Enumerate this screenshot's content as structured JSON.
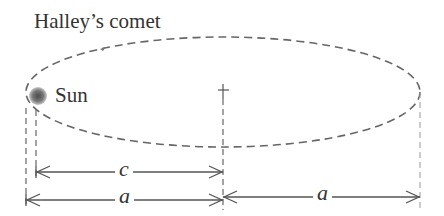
{
  "title": "Halley’s comet",
  "labels": {
    "sun": "Sun",
    "focal_distance": "c",
    "semi_major_left": "a",
    "semi_major_right": "a"
  },
  "colors": {
    "line": "#555555",
    "dashed": "#666666",
    "sun_center": "#555555",
    "sun_edge": "#bbbbbb",
    "text": "#333333"
  },
  "diagram": {
    "ellipse": {
      "cx": 223,
      "cy": 92,
      "rx": 197,
      "ry": 55,
      "style": "dashed"
    },
    "sun": {
      "cx": 38,
      "cy": 96,
      "r": 9
    },
    "center_marker": {
      "x": 223,
      "y": 96
    },
    "dimensions": [
      {
        "name": "c",
        "from_x": 36,
        "to_x": 223,
        "y": 172
      },
      {
        "name": "a",
        "from_x": 26,
        "to_x": 223,
        "y": 200
      },
      {
        "name": "a",
        "from_x": 223,
        "to_x": 420,
        "y": 197
      }
    ]
  }
}
